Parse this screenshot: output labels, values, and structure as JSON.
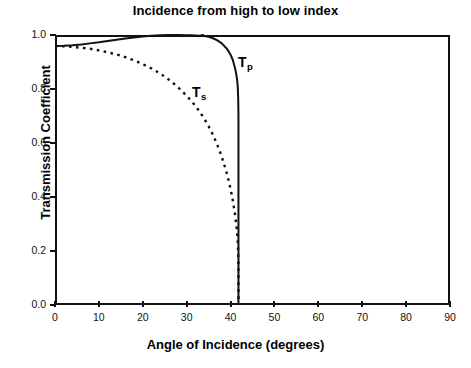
{
  "chart_data": {
    "type": "line",
    "title": "Incidence from high to low index",
    "xlabel": "Angle of Incidence (degrees)",
    "ylabel": "Transmission Coefficient",
    "xlim": [
      0,
      90
    ],
    "ylim": [
      0.0,
      1.0
    ],
    "xticks": [
      0,
      10,
      20,
      30,
      40,
      50,
      60,
      70,
      80,
      90
    ],
    "xtick_labels": [
      "0",
      "10",
      "20",
      "30",
      "40",
      "50",
      "60",
      "70",
      "80",
      "90"
    ],
    "yticks": [
      0.0,
      0.2,
      0.4,
      0.6,
      0.8,
      1.0
    ],
    "ytick_labels": [
      "0.0",
      "0.2",
      "0.4",
      "0.6",
      "0.8",
      "1.0"
    ],
    "grid": false,
    "legend_position": "inline-annotation",
    "critical_angle": 41.8,
    "brewster_angle": 33.7,
    "annotations": [
      {
        "name": "Tp",
        "text": "T",
        "sub": "p",
        "x_deg": 41.6,
        "y": 0.92
      },
      {
        "name": "Ts",
        "text": "T",
        "sub": "s",
        "x_deg": 31.1,
        "y": 0.81
      }
    ],
    "series": [
      {
        "name": "Tp",
        "label": "T_p",
        "style": "solid",
        "color": "#111111",
        "x": [
          0,
          2,
          4,
          6,
          8,
          10,
          12,
          14,
          16,
          18,
          20,
          22,
          24,
          26,
          28,
          30,
          31,
          32,
          33,
          33.7,
          34,
          35,
          36,
          37,
          38,
          39,
          39.5,
          40,
          40.5,
          41,
          41.3,
          41.5,
          41.65,
          41.75,
          41.8,
          41.8
        ],
        "values": [
          0.959,
          0.96,
          0.962,
          0.965,
          0.969,
          0.973,
          0.978,
          0.982,
          0.987,
          0.991,
          0.994,
          0.997,
          0.999,
          1.0,
          1.0,
          0.999,
          0.999,
          0.998,
          0.997,
          1.0,
          0.996,
          0.993,
          0.988,
          0.98,
          0.969,
          0.952,
          0.941,
          0.927,
          0.908,
          0.879,
          0.855,
          0.833,
          0.805,
          0.76,
          0.7,
          0.0
        ]
      },
      {
        "name": "Ts",
        "label": "T_s",
        "style": "dashed",
        "color": "#111111",
        "x": [
          0,
          2,
          4,
          6,
          8,
          10,
          12,
          14,
          16,
          18,
          20,
          22,
          24,
          26,
          28,
          30,
          31,
          32,
          33,
          34,
          35,
          36,
          37,
          38,
          39,
          39.5,
          40,
          40.5,
          41,
          41.3,
          41.5,
          41.65,
          41.75,
          41.8,
          41.8
        ],
        "values": [
          0.959,
          0.958,
          0.956,
          0.953,
          0.949,
          0.943,
          0.936,
          0.928,
          0.918,
          0.906,
          0.892,
          0.876,
          0.857,
          0.834,
          0.807,
          0.775,
          0.757,
          0.737,
          0.715,
          0.69,
          0.662,
          0.63,
          0.592,
          0.549,
          0.496,
          0.465,
          0.43,
          0.389,
          0.338,
          0.299,
          0.267,
          0.232,
          0.19,
          0.14,
          0.0
        ]
      }
    ]
  }
}
